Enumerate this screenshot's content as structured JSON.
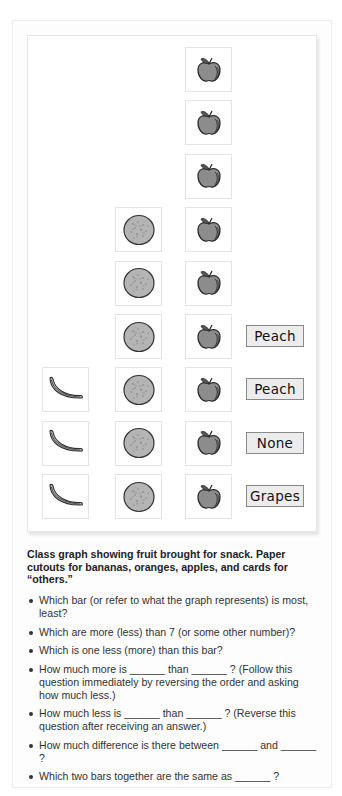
{
  "chart_data": {
    "type": "bar",
    "subtype": "pictograph",
    "title": "Class graph showing fruit brought for snack",
    "categories": [
      "Bananas",
      "Oranges",
      "Apples",
      "Others"
    ],
    "values": [
      3,
      6,
      9,
      4
    ],
    "others_cards": [
      "Peach",
      "Peach",
      "None",
      "Grapes"
    ],
    "xlabel": "",
    "ylabel": "",
    "orientation": "vertical, stacked from bottom",
    "grid": false,
    "legend": "none"
  },
  "graph": {
    "columns": [
      {
        "name": "bananas",
        "icon": "banana-icon",
        "count": 3
      },
      {
        "name": "oranges",
        "icon": "orange-icon",
        "count": 6
      },
      {
        "name": "apples",
        "icon": "apple-icon",
        "count": 9
      },
      {
        "name": "others",
        "icon": "word-card",
        "count": 4,
        "cards": [
          "Peach",
          "Peach",
          "None",
          "Grapes"
        ]
      }
    ]
  },
  "caption": "Class graph showing fruit brought for snack. Paper cutouts for bananas, oranges, apples, and cards for “others.”",
  "questions": [
    "Which bar (or refer to what the graph represents) is most, least?",
    "Which are more (less) than 7 (or some other number)?",
    "Which is one less (more) than this bar?",
    "How much more is ______ than ______ ? (Follow this question immediately by reversing the order and asking how much less.)",
    "How much less is ______ than ______ ? (Reverse this question after receiving an answer.)",
    "How much difference is there between ______ and ______ ?",
    "Which two bars together are the same as ______ ?"
  ],
  "colors": {
    "fruit_fill": "#8c8c8c",
    "orange_fill": "#b4b4b4",
    "card_fill": "#ececec",
    "card_border": "#8a8a8a"
  }
}
